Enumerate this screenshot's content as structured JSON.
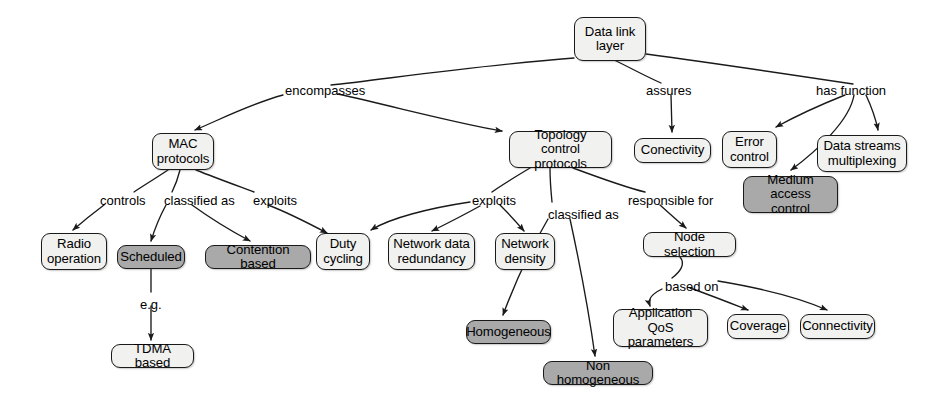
{
  "diagram": {
    "colors": {
      "shaded_fill": "#a9a9a9",
      "light_fill": "#f1f1ef",
      "stroke": "#1a1a1a",
      "text": "#000000",
      "background": "#ffffff"
    },
    "nodes": [
      {
        "id": "data-link-layer",
        "lines": [
          "Data link",
          "layer"
        ],
        "style": "light",
        "x": 574,
        "y": 17,
        "w": 72,
        "h": 44
      },
      {
        "id": "mac-protocols",
        "lines": [
          "MAC",
          "protocols"
        ],
        "style": "light",
        "x": 152,
        "y": 133,
        "w": 62,
        "h": 37
      },
      {
        "id": "topology-control",
        "lines": [
          "Topology control",
          "protocols"
        ],
        "style": "light",
        "x": 509,
        "y": 131,
        "w": 103,
        "h": 37
      },
      {
        "id": "conectivity",
        "lines": [
          "Conectivity"
        ],
        "style": "light",
        "x": 634,
        "y": 138,
        "w": 77,
        "h": 25
      },
      {
        "id": "error-control",
        "lines": [
          "Error",
          "control"
        ],
        "style": "light",
        "x": 722,
        "y": 131,
        "w": 55,
        "h": 37
      },
      {
        "id": "data-streams-mux",
        "lines": [
          "Data streams",
          "multiplexing"
        ],
        "style": "light",
        "x": 817,
        "y": 135,
        "w": 90,
        "h": 37
      },
      {
        "id": "medium-access-control",
        "lines": [
          "Medium access",
          "control"
        ],
        "style": "shaded",
        "x": 743,
        "y": 176,
        "w": 95,
        "h": 37
      },
      {
        "id": "radio-operation",
        "lines": [
          "Radio",
          "operation"
        ],
        "style": "light",
        "x": 41,
        "y": 233,
        "w": 66,
        "h": 37
      },
      {
        "id": "scheduled",
        "lines": [
          "Scheduled"
        ],
        "style": "shaded",
        "x": 117,
        "y": 245,
        "w": 68,
        "h": 24
      },
      {
        "id": "contention-based",
        "lines": [
          "Contention based"
        ],
        "style": "shaded",
        "x": 205,
        "y": 245,
        "w": 106,
        "h": 24
      },
      {
        "id": "duty-cycling",
        "lines": [
          "Duty",
          "cycling"
        ],
        "style": "light",
        "x": 316,
        "y": 233,
        "w": 54,
        "h": 37
      },
      {
        "id": "network-data-redundancy",
        "lines": [
          "Network data",
          "redundancy"
        ],
        "style": "light",
        "x": 388,
        "y": 233,
        "w": 87,
        "h": 37
      },
      {
        "id": "network-density",
        "lines": [
          "Network",
          "density"
        ],
        "style": "light",
        "x": 495,
        "y": 233,
        "w": 60,
        "h": 37
      },
      {
        "id": "node-selection",
        "lines": [
          "Node selection"
        ],
        "style": "light",
        "x": 643,
        "y": 232,
        "w": 93,
        "h": 25
      },
      {
        "id": "homogeneous",
        "lines": [
          "Homogeneous"
        ],
        "style": "shaded",
        "x": 466,
        "y": 320,
        "w": 85,
        "h": 24
      },
      {
        "id": "application-qos",
        "lines": [
          "Application",
          "QoS parameters"
        ],
        "style": "light",
        "x": 613,
        "y": 309,
        "w": 95,
        "h": 38
      },
      {
        "id": "coverage",
        "lines": [
          "Coverage"
        ],
        "style": "light",
        "x": 727,
        "y": 314,
        "w": 62,
        "h": 25
      },
      {
        "id": "connectivity",
        "lines": [
          "Connectivity"
        ],
        "style": "light",
        "x": 800,
        "y": 314,
        "w": 75,
        "h": 25
      },
      {
        "id": "non-homogeneous",
        "lines": [
          "Non homogeneous"
        ],
        "style": "shaded",
        "x": 543,
        "y": 361,
        "w": 110,
        "h": 24
      },
      {
        "id": "tdma-based",
        "lines": [
          "TDMA based"
        ],
        "style": "light",
        "x": 111,
        "y": 344,
        "w": 83,
        "h": 24
      }
    ],
    "edge_labels": [
      {
        "id": "encompasses",
        "text": "encompasses",
        "x": 285,
        "y": 84
      },
      {
        "id": "assures",
        "text": "assures",
        "x": 646,
        "y": 84
      },
      {
        "id": "has-function",
        "text": "has function",
        "x": 816,
        "y": 84
      },
      {
        "id": "controls",
        "text": "controls",
        "x": 100,
        "y": 194
      },
      {
        "id": "classified-as-1",
        "text": "classified as",
        "x": 164,
        "y": 194
      },
      {
        "id": "exploits-1",
        "text": "exploits",
        "x": 253,
        "y": 194
      },
      {
        "id": "exploits-2",
        "text": "exploits",
        "x": 472,
        "y": 194
      },
      {
        "id": "classified-as-2",
        "text": "classified as",
        "x": 548,
        "y": 208
      },
      {
        "id": "responsible-for",
        "text": "responsible for",
        "x": 628,
        "y": 194
      },
      {
        "id": "based-on",
        "text": "based on",
        "x": 665,
        "y": 280
      },
      {
        "id": "eg",
        "text": "e.g.",
        "x": 140,
        "y": 298
      }
    ],
    "edges": [
      {
        "from": "data-link-layer",
        "to": "encompasses",
        "arrow": false
      },
      {
        "from": "encompasses",
        "to": "mac-protocols",
        "arrow": true
      },
      {
        "from": "encompasses",
        "to": "topology-control",
        "arrow": true
      },
      {
        "from": "data-link-layer",
        "to": "assures",
        "arrow": false
      },
      {
        "from": "assures",
        "to": "conectivity",
        "arrow": true
      },
      {
        "from": "data-link-layer",
        "to": "has-function",
        "arrow": false
      },
      {
        "from": "has-function",
        "to": "error-control",
        "arrow": true
      },
      {
        "from": "has-function",
        "to": "medium-access-control",
        "arrow": true
      },
      {
        "from": "has-function",
        "to": "data-streams-mux",
        "arrow": true
      },
      {
        "from": "mac-protocols",
        "to": "controls",
        "arrow": false
      },
      {
        "from": "controls",
        "to": "radio-operation",
        "arrow": true
      },
      {
        "from": "mac-protocols",
        "to": "classified-as-1",
        "arrow": false
      },
      {
        "from": "classified-as-1",
        "to": "scheduled",
        "arrow": true
      },
      {
        "from": "classified-as-1",
        "to": "contention-based",
        "arrow": true
      },
      {
        "from": "mac-protocols",
        "to": "exploits-1",
        "arrow": false
      },
      {
        "from": "exploits-1",
        "to": "duty-cycling",
        "arrow": true
      },
      {
        "from": "scheduled",
        "to": "eg",
        "arrow": false
      },
      {
        "from": "eg",
        "to": "tdma-based",
        "arrow": true
      },
      {
        "from": "topology-control",
        "to": "exploits-2",
        "arrow": false
      },
      {
        "from": "exploits-2",
        "to": "duty-cycling",
        "arrow": true
      },
      {
        "from": "exploits-2",
        "to": "network-data-redundancy",
        "arrow": true
      },
      {
        "from": "exploits-2",
        "to": "network-density",
        "arrow": true
      },
      {
        "from": "topology-control",
        "to": "classified-as-2",
        "arrow": false
      },
      {
        "from": "classified-as-2",
        "to": "homogeneous",
        "arrow": true
      },
      {
        "from": "classified-as-2",
        "to": "non-homogeneous",
        "arrow": true
      },
      {
        "from": "topology-control",
        "to": "responsible-for",
        "arrow": false
      },
      {
        "from": "responsible-for",
        "to": "node-selection",
        "arrow": true
      },
      {
        "from": "node-selection",
        "to": "based-on",
        "arrow": false
      },
      {
        "from": "based-on",
        "to": "application-qos",
        "arrow": true
      },
      {
        "from": "based-on",
        "to": "coverage",
        "arrow": true
      },
      {
        "from": "based-on",
        "to": "connectivity",
        "arrow": true
      }
    ]
  }
}
